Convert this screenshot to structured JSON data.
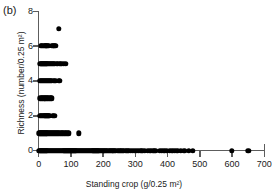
{
  "panel": {
    "label": "(b)"
  },
  "chart_data": {
    "type": "scatter",
    "title": "",
    "xlabel": "Standing crop (g/0.25 m²)",
    "ylabel": "Richness (number/0.25 m²)",
    "xlim": [
      0,
      700
    ],
    "ylim": [
      0,
      8
    ],
    "xticks": [
      0,
      100,
      200,
      300,
      400,
      500,
      600,
      700
    ],
    "yticks": [
      0,
      2,
      4,
      6,
      8
    ],
    "xtick_labels": [
      "0",
      "100",
      "200",
      "300",
      "400",
      "500",
      "600",
      "700"
    ],
    "ytick_labels": [
      "0",
      "2",
      "4",
      "6",
      "8"
    ],
    "grid": false,
    "legend": null,
    "marker": "filled-circle",
    "marker_color": "#000000",
    "points": [
      [
        62,
        7
      ],
      [
        6,
        6
      ],
      [
        10,
        6
      ],
      [
        14,
        6
      ],
      [
        18,
        6
      ],
      [
        22,
        6
      ],
      [
        24,
        6
      ],
      [
        27,
        6
      ],
      [
        31,
        6
      ],
      [
        41,
        6
      ],
      [
        45,
        6
      ],
      [
        49,
        6
      ],
      [
        53,
        6
      ],
      [
        5,
        5
      ],
      [
        8,
        5
      ],
      [
        11,
        5
      ],
      [
        14,
        5
      ],
      [
        17,
        5
      ],
      [
        20,
        5
      ],
      [
        23,
        5
      ],
      [
        26,
        5
      ],
      [
        29,
        5
      ],
      [
        32,
        5
      ],
      [
        35,
        5
      ],
      [
        38,
        5
      ],
      [
        41,
        5
      ],
      [
        44,
        5
      ],
      [
        47,
        5
      ],
      [
        50,
        5
      ],
      [
        56,
        5
      ],
      [
        60,
        5
      ],
      [
        66,
        5
      ],
      [
        70,
        5
      ],
      [
        78,
        5
      ],
      [
        84,
        5
      ],
      [
        4,
        4
      ],
      [
        7,
        4
      ],
      [
        10,
        4
      ],
      [
        13,
        4
      ],
      [
        16,
        4
      ],
      [
        19,
        4
      ],
      [
        22,
        4
      ],
      [
        25,
        4
      ],
      [
        28,
        4
      ],
      [
        31,
        4
      ],
      [
        34,
        4
      ],
      [
        37,
        4
      ],
      [
        40,
        4
      ],
      [
        47,
        4
      ],
      [
        51,
        4
      ],
      [
        62,
        4
      ],
      [
        66,
        4
      ],
      [
        5,
        3
      ],
      [
        9,
        3
      ],
      [
        13,
        3
      ],
      [
        17,
        3
      ],
      [
        21,
        3
      ],
      [
        25,
        3
      ],
      [
        29,
        3
      ],
      [
        33,
        3
      ],
      [
        37,
        3
      ],
      [
        41,
        3
      ],
      [
        3,
        2
      ],
      [
        6,
        2
      ],
      [
        9,
        2
      ],
      [
        12,
        2
      ],
      [
        15,
        2
      ],
      [
        18,
        2
      ],
      [
        21,
        2
      ],
      [
        24,
        2
      ],
      [
        27,
        2
      ],
      [
        30,
        2
      ],
      [
        33,
        2
      ],
      [
        44,
        2
      ],
      [
        48,
        2
      ],
      [
        2,
        1
      ],
      [
        5,
        1
      ],
      [
        8,
        1
      ],
      [
        11,
        1
      ],
      [
        14,
        1
      ],
      [
        17,
        1
      ],
      [
        20,
        1
      ],
      [
        23,
        1
      ],
      [
        26,
        1
      ],
      [
        29,
        1
      ],
      [
        32,
        1
      ],
      [
        35,
        1
      ],
      [
        38,
        1
      ],
      [
        41,
        1
      ],
      [
        44,
        1
      ],
      [
        47,
        1
      ],
      [
        50,
        1
      ],
      [
        53,
        1
      ],
      [
        56,
        1
      ],
      [
        59,
        1
      ],
      [
        63,
        1
      ],
      [
        67,
        1
      ],
      [
        71,
        1
      ],
      [
        75,
        1
      ],
      [
        79,
        1
      ],
      [
        84,
        1
      ],
      [
        89,
        1
      ],
      [
        94,
        1
      ],
      [
        125,
        1
      ],
      [
        2,
        0
      ],
      [
        5,
        0
      ],
      [
        8,
        0
      ],
      [
        11,
        0
      ],
      [
        14,
        0
      ],
      [
        17,
        0
      ],
      [
        20,
        0
      ],
      [
        23,
        0
      ],
      [
        26,
        0
      ],
      [
        29,
        0
      ],
      [
        32,
        0
      ],
      [
        35,
        0
      ],
      [
        38,
        0
      ],
      [
        41,
        0
      ],
      [
        44,
        0
      ],
      [
        47,
        0
      ],
      [
        50,
        0
      ],
      [
        53,
        0
      ],
      [
        56,
        0
      ],
      [
        59,
        0
      ],
      [
        62,
        0
      ],
      [
        65,
        0
      ],
      [
        68,
        0
      ],
      [
        71,
        0
      ],
      [
        74,
        0
      ],
      [
        77,
        0
      ],
      [
        80,
        0
      ],
      [
        83,
        0
      ],
      [
        86,
        0
      ],
      [
        89,
        0
      ],
      [
        92,
        0
      ],
      [
        95,
        0
      ],
      [
        98,
        0
      ],
      [
        101,
        0
      ],
      [
        104,
        0
      ],
      [
        107,
        0
      ],
      [
        110,
        0
      ],
      [
        113,
        0
      ],
      [
        116,
        0
      ],
      [
        119,
        0
      ],
      [
        122,
        0
      ],
      [
        125,
        0
      ],
      [
        128,
        0
      ],
      [
        131,
        0
      ],
      [
        134,
        0
      ],
      [
        137,
        0
      ],
      [
        140,
        0
      ],
      [
        143,
        0
      ],
      [
        146,
        0
      ],
      [
        149,
        0
      ],
      [
        152,
        0
      ],
      [
        155,
        0
      ],
      [
        158,
        0
      ],
      [
        161,
        0
      ],
      [
        164,
        0
      ],
      [
        167,
        0
      ],
      [
        170,
        0
      ],
      [
        173,
        0
      ],
      [
        176,
        0
      ],
      [
        179,
        0
      ],
      [
        182,
        0
      ],
      [
        185,
        0
      ],
      [
        188,
        0
      ],
      [
        192,
        0
      ],
      [
        196,
        0
      ],
      [
        200,
        0
      ],
      [
        204,
        0
      ],
      [
        208,
        0
      ],
      [
        212,
        0
      ],
      [
        216,
        0
      ],
      [
        220,
        0
      ],
      [
        224,
        0
      ],
      [
        228,
        0
      ],
      [
        232,
        0
      ],
      [
        236,
        0
      ],
      [
        240,
        0
      ],
      [
        245,
        0
      ],
      [
        250,
        0
      ],
      [
        255,
        0
      ],
      [
        260,
        0
      ],
      [
        265,
        0
      ],
      [
        270,
        0
      ],
      [
        275,
        0
      ],
      [
        280,
        0
      ],
      [
        286,
        0
      ],
      [
        292,
        0
      ],
      [
        298,
        0
      ],
      [
        304,
        0
      ],
      [
        310,
        0
      ],
      [
        316,
        0
      ],
      [
        322,
        0
      ],
      [
        330,
        0
      ],
      [
        338,
        0
      ],
      [
        346,
        0
      ],
      [
        356,
        0
      ],
      [
        362,
        0
      ],
      [
        375,
        0
      ],
      [
        382,
        0
      ],
      [
        390,
        0
      ],
      [
        398,
        0
      ],
      [
        406,
        0
      ],
      [
        414,
        0
      ],
      [
        422,
        0
      ],
      [
        430,
        0
      ],
      [
        440,
        0
      ],
      [
        452,
        0
      ],
      [
        465,
        0
      ],
      [
        478,
        0
      ],
      [
        600,
        0
      ],
      [
        650,
        0
      ]
    ]
  }
}
